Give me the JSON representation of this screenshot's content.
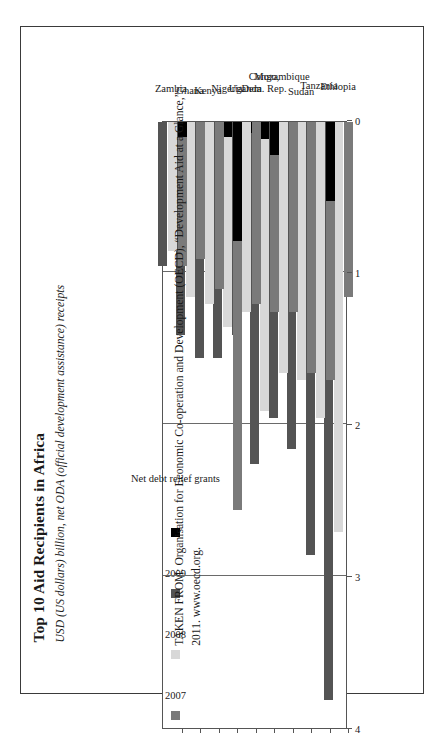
{
  "scan_fragment": "  ",
  "figure": {
    "title": "Top 10 Aid Recipients in Africa",
    "subtitle": "USD (US dollars) billion, net ODA (official development assistance) receipts"
  },
  "source": {
    "line1": "TAKEN FROM: Organisation for Economic Co-operation and Development (OECD), “Development Aid at a Glance,”",
    "line2": "2011. www.oecd.org."
  },
  "legend": {
    "items": [
      {
        "label": "2007",
        "color": "#7a7a7a",
        "name": "legend-2007"
      },
      {
        "label": "2008",
        "color": "#d8d8d8",
        "name": "legend-2008"
      },
      {
        "label": "2009",
        "color": "#545454",
        "name": "legend-2009"
      },
      {
        "label": "Net debt relief grants",
        "color": "#000000",
        "name": "legend-debt-relief"
      }
    ]
  },
  "axis": {
    "ticks": [
      "4",
      "3",
      "2",
      "1",
      "0"
    ],
    "tick_values": [
      4,
      3,
      2,
      1,
      0
    ],
    "min": 0,
    "max": 4
  },
  "chart_data": {
    "type": "bar",
    "orientation": "horizontal",
    "title": "Top 10 Aid Recipients in Africa",
    "subtitle": "USD (US dollars) billion, net ODA (official development assistance) receipts",
    "xlabel": "USD (US dollars) billion",
    "ylabel": "",
    "xlim": [
      0,
      4
    ],
    "xticks": [
      0,
      1,
      2,
      3,
      4
    ],
    "grid": true,
    "legend_position": "inside-upper-left",
    "categories": [
      "Ethiopia",
      "Tanzania",
      "Sudan",
      "Mozambique",
      "Congo, Dem. Rep.",
      "Uganda",
      "Nigeria",
      "Kenya",
      "Ghana",
      "Zambia"
    ],
    "series": [
      {
        "name": "2007",
        "color": "#7a7a7a",
        "values": [
          1.15,
          1.7,
          1.65,
          1.25,
          1.25,
          1.2,
          2.55,
          1.1,
          0.9,
          0.95
        ]
      },
      {
        "name": "2008",
        "color": "#d8d8d8",
        "values": [
          2.7,
          1.95,
          1.7,
          1.65,
          1.9,
          1.25,
          1.35,
          1.2,
          1.15,
          0.85
        ]
      },
      {
        "name": "2009",
        "color": "#545454",
        "values": [
          3.8,
          2.85,
          2.15,
          1.95,
          2.25,
          1.4,
          1.55,
          1.55,
          1.4,
          0.95
        ]
      }
    ],
    "debt_relief_grants": {
      "name": "Net debt relief grants",
      "color": "#000000",
      "note": "Black segment shown at the 0-end of the bar, included within the bar total",
      "by_category": {
        "Ethiopia": {
          "2007": 0.0,
          "2008": 0.0,
          "2009": 0.0
        },
        "Tanzania": {
          "2007": 0.52,
          "2008": 0.0,
          "2009": 0.0
        },
        "Sudan": {
          "2007": 0.0,
          "2008": 0.0,
          "2009": 0.0
        },
        "Mozambique": {
          "2007": 0.0,
          "2008": 0.0,
          "2009": 0.0
        },
        "Congo, Dem. Rep.": {
          "2007": 0.22,
          "2008": 0.11,
          "2009": 0.07
        },
        "Uganda": {
          "2007": 0.0,
          "2008": 0.0,
          "2009": 0.0
        },
        "Nigeria": {
          "2007": 0.78,
          "2008": 0.1,
          "2009": 0.0
        },
        "Kenya": {
          "2007": 0.0,
          "2008": 0.0,
          "2009": 0.0
        },
        "Ghana": {
          "2007": 0.0,
          "2008": 0.0,
          "2009": 0.0
        },
        "Zambia": {
          "2007": 0.1,
          "2008": 0.0,
          "2009": 0.0
        }
      }
    }
  }
}
